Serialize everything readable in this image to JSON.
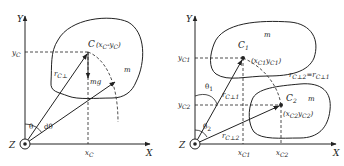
{
  "colors": {
    "stroke": "#222222",
    "background": "#ffffff"
  },
  "left_diagram": {
    "y_axis_label": "Y",
    "x_axis_label": "X",
    "origin_label": "Z",
    "y_tick_label": "y",
    "y_tick_sub": "C",
    "x_tick_label": "x",
    "x_tick_sub": "C",
    "center_label": "C",
    "center_coords": "(x",
    "center_coords_sub1": "C",
    "center_coords_mid": "-y",
    "center_coords_sub2": "C",
    "center_coords_end": ")",
    "radius_label": "r",
    "radius_sub": "C⊥",
    "weight_label": "mg",
    "mass_label": "m",
    "angle_label": "θ",
    "dangle_label": "dθ"
  },
  "right_diagram": {
    "y_axis_label": "Y",
    "x_axis_label": "X",
    "origin_label": "Z",
    "y_tick1_label": "y",
    "y_tick1_sub": "C1",
    "y_tick2_label": "y",
    "y_tick2_sub": "C2",
    "x_tick1_label": "x",
    "x_tick1_sub": "C1",
    "x_tick2_label": "x",
    "x_tick2_sub": "C2",
    "c1_label": "C",
    "c1_sub": "1",
    "c1_coords": "(x",
    "c1_coords_sub1": "C1",
    "c1_coords_mid": "y",
    "c1_coords_sub2": "C1",
    "c1_coords_end": ")",
    "c2_label": "C",
    "c2_sub": "2",
    "c2_coords": "(x",
    "c2_coords_sub1": "C2",
    "c2_coords_mid": "y",
    "c2_coords_sub2": "C2",
    "c2_coords_end": ")",
    "mass1_label": "m",
    "mass2_label": "m",
    "r1_label": "r",
    "r1_sub": "C⊥1",
    "r2_label": "r",
    "r2_sub": "C⊥2",
    "equality_label": "r",
    "equality_sub1": "C⊥2",
    "equality_mid": "=r",
    "equality_sub2": "C⊥1",
    "theta1_label": "θ",
    "theta1_sub": "1",
    "theta2_label": "θ",
    "theta2_sub": "2"
  }
}
